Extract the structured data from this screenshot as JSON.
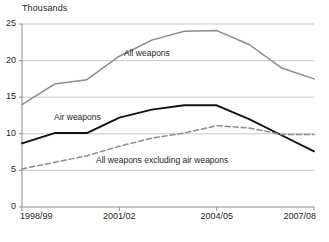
{
  "chart_data": {
    "type": "line",
    "title": "",
    "unit_label": "Thousands",
    "xlabel": "",
    "ylabel": "Thousands",
    "grid": true,
    "legend_position": "inline-annotations",
    "ylim": [
      0,
      25
    ],
    "yticks": [
      0,
      5,
      10,
      15,
      20,
      25
    ],
    "x": [
      "1998/99",
      "1999/00",
      "2000/01",
      "2001/02",
      "2002/03",
      "2003/04",
      "2004/05",
      "2005/06",
      "2006/07",
      "2007/08"
    ],
    "xtick_labels": [
      "1998/99",
      "2001/02",
      "2004/05",
      "2007/08"
    ],
    "xtick_indices": [
      0,
      3,
      6,
      9
    ],
    "series": [
      {
        "name": "All weapons",
        "style": "solid",
        "color": "#8c8c8c",
        "values": [
          14.0,
          16.8,
          17.4,
          20.6,
          22.8,
          24.0,
          24.1,
          22.2,
          19.0,
          17.5
        ]
      },
      {
        "name": "Air weapons",
        "style": "solid",
        "color": "#111111",
        "values": [
          8.7,
          10.1,
          10.1,
          12.2,
          13.3,
          13.9,
          13.9,
          12.0,
          9.8,
          7.6
        ]
      },
      {
        "name": "All weapons excluding air weapons",
        "style": "dashed",
        "color": "#8c8c8c",
        "values": [
          5.2,
          6.1,
          7.0,
          8.3,
          9.4,
          10.1,
          11.1,
          10.8,
          9.9,
          9.9
        ]
      }
    ],
    "annotations": [
      {
        "text": "All weapons",
        "x": 124,
        "y": 48
      },
      {
        "text": "Air weapons",
        "x": 54,
        "y": 112
      },
      {
        "text": "All weapons excluding air weapons",
        "x": 96,
        "y": 155
      }
    ]
  }
}
